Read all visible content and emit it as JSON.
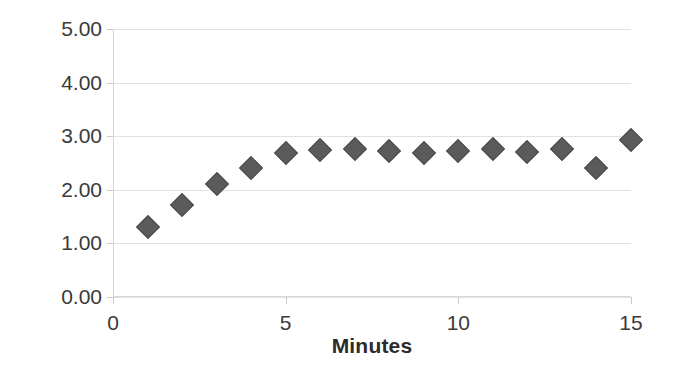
{
  "chart_data": {
    "type": "scatter",
    "title": "",
    "xlabel": "Minutes",
    "ylabel": "RMS (mm)",
    "x": [
      1,
      2,
      3,
      4,
      5,
      6,
      7,
      8,
      9,
      10,
      11,
      12,
      13,
      14,
      15
    ],
    "values": [
      1.3,
      1.72,
      2.11,
      2.4,
      2.68,
      2.75,
      2.76,
      2.72,
      2.69,
      2.72,
      2.77,
      2.7,
      2.76,
      2.41,
      2.93
    ],
    "series": [
      {
        "name": "RMS",
        "marker": "diamond",
        "color": "#5b5b5b",
        "values": [
          1.3,
          1.72,
          2.11,
          2.4,
          2.68,
          2.75,
          2.76,
          2.72,
          2.69,
          2.72,
          2.77,
          2.7,
          2.76,
          2.41,
          2.93
        ]
      }
    ],
    "xlim": [
      0,
      15
    ],
    "ylim": [
      0.0,
      5.0
    ],
    "x_tick_labels": [
      "0",
      "5",
      "10",
      "15"
    ],
    "x_tick_values": [
      0,
      5,
      10,
      15
    ],
    "y_tick_labels": [
      "0.00",
      "1.00",
      "2.00",
      "3.00",
      "4.00",
      "5.00"
    ],
    "y_tick_values": [
      0,
      1,
      2,
      3,
      4,
      5
    ],
    "grid": "horizontal",
    "legend": "none",
    "gridline_color": "#e2e2e2",
    "axis_text_color": "#3a3a3a",
    "background_color": "#ffffff"
  }
}
